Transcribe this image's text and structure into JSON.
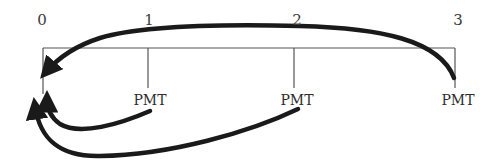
{
  "timeline": {
    "periods": [
      {
        "label": "0",
        "x": 42
      },
      {
        "label": "1",
        "x": 149
      },
      {
        "label": "2",
        "x": 297
      },
      {
        "label": "3",
        "x": 458
      }
    ],
    "payments": [
      {
        "label": "PMT",
        "period": 1,
        "x": 150
      },
      {
        "label": "PMT",
        "period": 2,
        "x": 297
      },
      {
        "label": "PMT",
        "period": 3,
        "x": 458
      }
    ]
  },
  "arrows": [
    {
      "from_period": 3,
      "to_period": 0,
      "direction": "discount-to-present",
      "route": "above"
    },
    {
      "from_period": 1,
      "to_period": 0,
      "direction": "discount-to-present",
      "route": "below"
    },
    {
      "from_period": 2,
      "to_period": 0,
      "direction": "discount-to-present",
      "route": "below"
    }
  ],
  "colors": {
    "line": "#555555",
    "arrow": "#1a1a1a",
    "text": "#3a3a3a"
  }
}
